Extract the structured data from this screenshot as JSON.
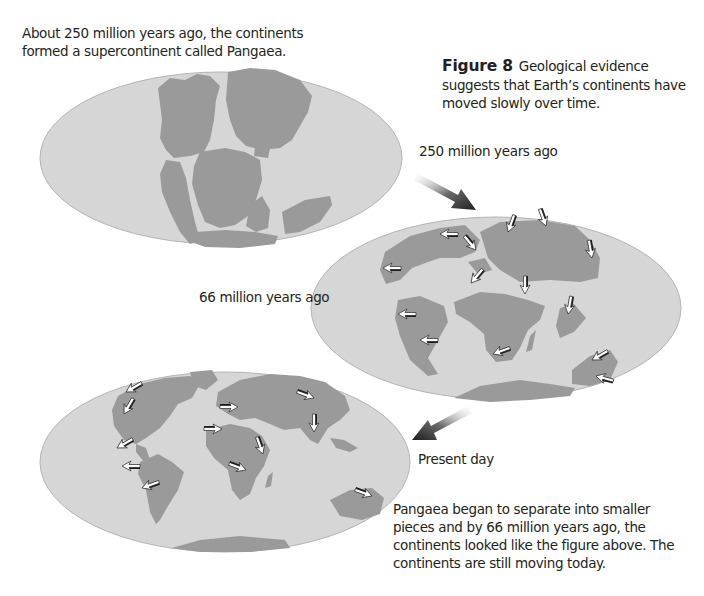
{
  "intro_text": "About 250 million years ago, the continents formed a supercontinent called Pangaea.",
  "caption": {
    "figure_label": "Figure 8",
    "text": "Geological evidence suggests that Earth’s continents have moved slowly over time."
  },
  "maps": [
    {
      "id": "pangaea",
      "label": "250 million years ago",
      "has_motion_arrows": false
    },
    {
      "id": "cretaceous",
      "label": "66 million years ago",
      "has_motion_arrows": true
    },
    {
      "id": "present",
      "label": "Present day",
      "has_motion_arrows": true
    }
  ],
  "bottom_text": "Pangaea began to separate into smaller pieces and by 66 million years ago, the continents looked like the figure above. The continents are still moving today.",
  "colors": {
    "ocean": "#d6d6d6",
    "land": "#9a9a9a",
    "ellipse_edge": "#b4b4b4",
    "transition_arrow": "#2a2a2a",
    "text": "#231f20"
  }
}
